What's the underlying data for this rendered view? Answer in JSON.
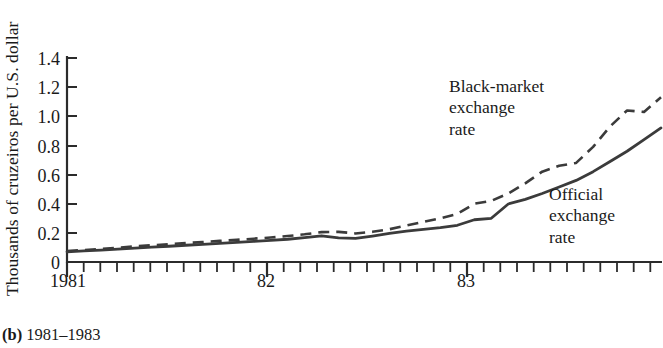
{
  "chart_data": {
    "type": "line",
    "title": "",
    "caption_label": "(b)",
    "caption_range": "1981–1983",
    "ylabel": "Thousands of cruzeiros per U.S. dollar",
    "xlabel": "",
    "ylim": [
      0,
      1.4
    ],
    "ytick_labels": [
      "1.4",
      "1.2",
      "1.0",
      "0.8",
      "0.6",
      "0.4",
      "0.2",
      "0"
    ],
    "ytick_values": [
      1.4,
      1.2,
      1.0,
      0.8,
      0.6,
      0.4,
      0.2,
      0
    ],
    "xtick_labels": [
      "1981",
      "82",
      "83"
    ],
    "xtick_values": [
      0,
      12,
      24
    ],
    "xlim": [
      0,
      35
    ],
    "x_minor_ticks": "monthly",
    "grid": false,
    "legend_position": "inline-annotations",
    "series": [
      {
        "name": "Black-market exchange rate",
        "style": "dashed",
        "color": "#3b3b3b",
        "x": [
          0,
          1,
          2,
          3,
          4,
          5,
          6,
          7,
          8,
          9,
          10,
          11,
          12,
          13,
          14,
          15,
          16,
          17,
          18,
          19,
          20,
          21,
          22,
          23,
          24,
          25,
          26,
          27,
          28,
          29,
          30,
          31,
          32,
          33,
          34,
          35
        ],
        "values": [
          0.075,
          0.082,
          0.09,
          0.098,
          0.107,
          0.115,
          0.122,
          0.13,
          0.137,
          0.145,
          0.152,
          0.16,
          0.168,
          0.178,
          0.19,
          0.205,
          0.207,
          0.196,
          0.207,
          0.225,
          0.25,
          0.275,
          0.3,
          0.33,
          0.4,
          0.42,
          0.47,
          0.54,
          0.62,
          0.66,
          0.68,
          0.79,
          0.93,
          1.04,
          1.03,
          1.13
        ]
      },
      {
        "name": "Official exchange rate",
        "style": "solid",
        "color": "#3b3b3b",
        "x": [
          0,
          1,
          2,
          3,
          4,
          5,
          6,
          7,
          8,
          9,
          10,
          11,
          12,
          13,
          14,
          15,
          16,
          17,
          18,
          19,
          20,
          21,
          22,
          23,
          24,
          25,
          26,
          27,
          28,
          29,
          30,
          31,
          32,
          33,
          34,
          35
        ],
        "values": [
          0.07,
          0.076,
          0.082,
          0.089,
          0.095,
          0.102,
          0.108,
          0.115,
          0.121,
          0.128,
          0.134,
          0.141,
          0.148,
          0.156,
          0.167,
          0.18,
          0.166,
          0.162,
          0.178,
          0.196,
          0.212,
          0.224,
          0.236,
          0.252,
          0.29,
          0.3,
          0.398,
          0.43,
          0.47,
          0.515,
          0.56,
          0.62,
          0.69,
          0.76,
          0.84,
          0.92
        ]
      }
    ],
    "annotations": [
      {
        "name": "black-market-label",
        "lines": [
          "Black-market",
          "exchange",
          "rate"
        ],
        "x_px": 449,
        "y_px": 76
      },
      {
        "name": "official-label",
        "lines": [
          "Official",
          "exchange",
          "rate"
        ],
        "x_px": 549,
        "y_px": 184
      }
    ]
  },
  "axes": {
    "plot_left_px": 67,
    "plot_right_px": 661,
    "plot_top_px": 58,
    "plot_bottom_px": 262
  }
}
